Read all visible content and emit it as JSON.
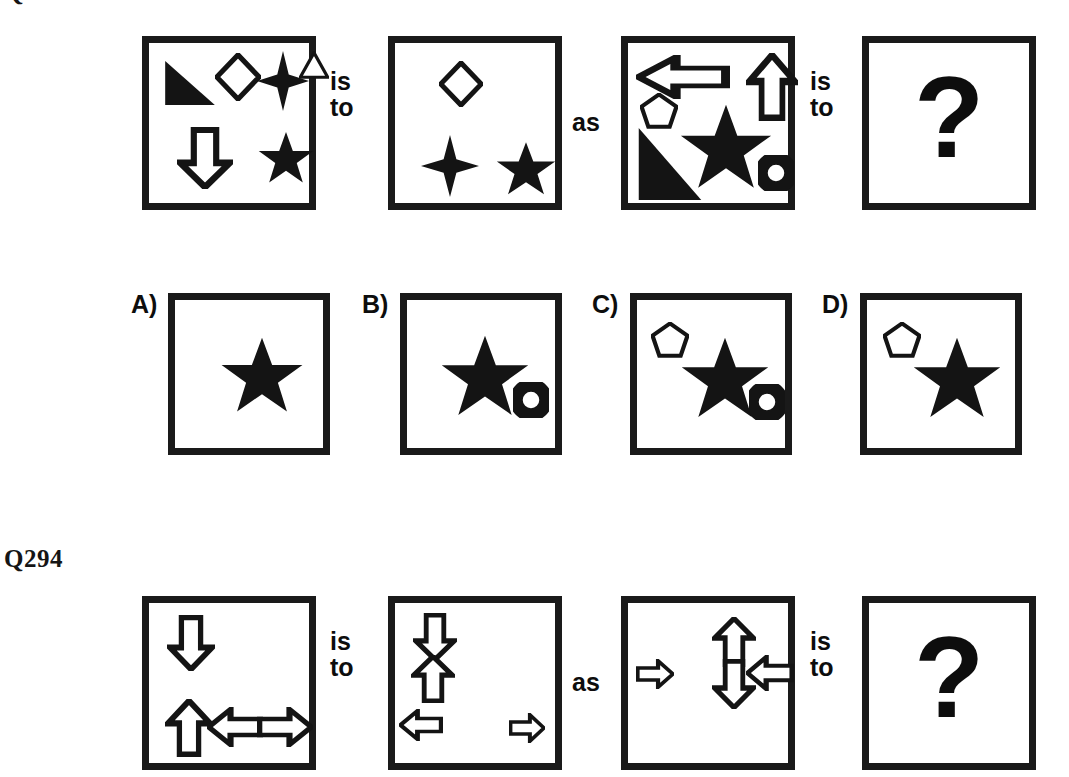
{
  "page": {
    "background": "#ffffff",
    "ink": "#151515",
    "width": 1069,
    "height": 777
  },
  "questions": [
    {
      "id": "q293",
      "label": "Q",
      "label_clipped": true,
      "connector_first": "is\nto",
      "connector_middle": "as",
      "connector_second": "is\nto",
      "panels": [
        {
          "name": "panel-a",
          "shapes": [
            {
              "type": "right-triangle",
              "fill": "solid",
              "x": 14,
              "y": 16,
              "w": 54,
              "h": 48
            },
            {
              "type": "diamond",
              "fill": "outline",
              "x": 66,
              "y": 10,
              "w": 46,
              "h": 48
            },
            {
              "type": "four-point-star",
              "fill": "solid",
              "x": 108,
              "y": 8,
              "w": 52,
              "h": 60
            },
            {
              "type": "triangle",
              "fill": "outline",
              "x": 150,
              "y": 8,
              "w": 30,
              "h": 28
            },
            {
              "type": "down-arrow",
              "fill": "outline",
              "x": 28,
              "y": 84,
              "w": 56,
              "h": 62
            },
            {
              "type": "five-point-star",
              "fill": "solid",
              "x": 108,
              "y": 88,
              "w": 58,
              "h": 56
            }
          ]
        },
        {
          "name": "panel-b",
          "shapes": [
            {
              "type": "diamond",
              "fill": "outline",
              "x": 44,
              "y": 18,
              "w": 44,
              "h": 46
            },
            {
              "type": "four-point-star",
              "fill": "solid",
              "x": 26,
              "y": 92,
              "w": 58,
              "h": 62
            },
            {
              "type": "five-point-star",
              "fill": "solid",
              "x": 100,
              "y": 98,
              "w": 62,
              "h": 58
            }
          ]
        },
        {
          "name": "panel-c",
          "shapes": [
            {
              "type": "left-arrow",
              "fill": "outline",
              "x": 8,
              "y": 12,
              "w": 94,
              "h": 44
            },
            {
              "type": "up-arrow",
              "fill": "outline",
              "x": 118,
              "y": 10,
              "w": 52,
              "h": 68
            },
            {
              "type": "pentagon",
              "fill": "outline",
              "x": 12,
              "y": 50,
              "w": 38,
              "h": 36
            },
            {
              "type": "right-triangle",
              "fill": "solid",
              "x": 8,
              "y": 82,
              "w": 68,
              "h": 78
            },
            {
              "type": "five-point-star",
              "fill": "solid",
              "x": 50,
              "y": 60,
              "w": 96,
              "h": 92
            },
            {
              "type": "circle",
              "fill": "outline",
              "x": 130,
              "y": 112,
              "w": 36,
              "h": 36
            }
          ]
        },
        {
          "name": "panel-answer",
          "question_mark": "?",
          "shapes": []
        }
      ],
      "options": [
        {
          "label": "A)",
          "name": "option-a",
          "shapes": [
            {
              "type": "five-point-star",
              "fill": "solid",
              "x": 44,
              "y": 36,
              "w": 86,
              "h": 82
            }
          ]
        },
        {
          "label": "B)",
          "name": "option-b",
          "shapes": [
            {
              "type": "five-point-star",
              "fill": "solid",
              "x": 32,
              "y": 34,
              "w": 92,
              "h": 88
            },
            {
              "type": "circle",
              "fill": "outline",
              "x": 106,
              "y": 82,
              "w": 36,
              "h": 36
            }
          ]
        },
        {
          "label": "C)",
          "name": "option-c",
          "shapes": [
            {
              "type": "pentagon",
              "fill": "outline",
              "x": 14,
              "y": 22,
              "w": 38,
              "h": 36
            },
            {
              "type": "five-point-star",
              "fill": "solid",
              "x": 42,
              "y": 36,
              "w": 92,
              "h": 88
            },
            {
              "type": "circle",
              "fill": "outline",
              "x": 112,
              "y": 84,
              "w": 36,
              "h": 36
            }
          ]
        },
        {
          "label": "D)",
          "name": "option-d",
          "shapes": [
            {
              "type": "pentagon",
              "fill": "outline",
              "x": 16,
              "y": 22,
              "w": 38,
              "h": 36
            },
            {
              "type": "five-point-star",
              "fill": "solid",
              "x": 44,
              "y": 36,
              "w": 92,
              "h": 88
            }
          ]
        }
      ]
    },
    {
      "id": "q294",
      "label": "Q294",
      "label_clipped": false,
      "connector_first": "is\nto",
      "connector_middle": "as",
      "connector_second": "is\nto",
      "panels": [
        {
          "name": "panel-a",
          "shapes": [
            {
              "type": "down-arrow",
              "fill": "outline",
              "x": 18,
              "y": 12,
              "w": 48,
              "h": 56
            },
            {
              "type": "up-arrow",
              "fill": "outline",
              "x": 16,
              "y": 96,
              "w": 48,
              "h": 58
            },
            {
              "type": "left-arrow",
              "fill": "outline",
              "x": 58,
              "y": 104,
              "w": 56,
              "h": 40
            },
            {
              "type": "right-arrow",
              "fill": "outline",
              "x": 108,
              "y": 104,
              "w": 56,
              "h": 40
            }
          ]
        },
        {
          "name": "panel-b",
          "shapes": [
            {
              "type": "down-arrow",
              "fill": "outline",
              "x": 18,
              "y": 10,
              "w": 44,
              "h": 48
            },
            {
              "type": "up-arrow",
              "fill": "outline",
              "x": 16,
              "y": 52,
              "w": 44,
              "h": 48
            },
            {
              "type": "left-arrow",
              "fill": "outline",
              "x": 4,
              "y": 106,
              "w": 44,
              "h": 32
            },
            {
              "type": "right-arrow",
              "fill": "outline",
              "x": 114,
              "y": 110,
              "w": 36,
              "h": 30
            }
          ]
        },
        {
          "name": "panel-c",
          "shapes": [
            {
              "type": "right-arrow",
              "fill": "outline",
              "x": 8,
              "y": 56,
              "w": 38,
              "h": 30
            },
            {
              "type": "up-arrow",
              "fill": "outline",
              "x": 84,
              "y": 14,
              "w": 44,
              "h": 50
            },
            {
              "type": "down-arrow",
              "fill": "outline",
              "x": 84,
              "y": 56,
              "w": 44,
              "h": 50
            },
            {
              "type": "left-arrow",
              "fill": "outline",
              "x": 118,
              "y": 52,
              "w": 48,
              "h": 36
            }
          ]
        },
        {
          "name": "panel-answer",
          "question_mark": "?",
          "shapes": []
        }
      ],
      "options": []
    }
  ]
}
